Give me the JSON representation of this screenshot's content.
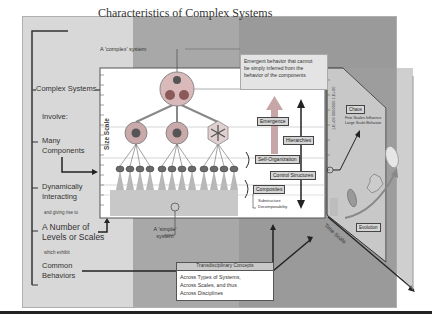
{
  "title": "Characteristics of Complex Systems",
  "left_column": {
    "header": "Complex Systems",
    "involve": "Involve:",
    "many_components": [
      "Many",
      "Components"
    ],
    "dynamically_interacting": [
      "Dynamically",
      "Interacting"
    ],
    "giving_rise": "and giving rise to",
    "levels_or_scales": [
      "A Number of",
      "Levels or Scales"
    ],
    "which_exhibit": "which exhibit",
    "common_behaviors": [
      "Common",
      "Behaviors"
    ]
  },
  "diagram": {
    "complex_system_label": "A 'complex' system",
    "simple_system_label": [
      "A 'simple'",
      "system"
    ],
    "emergent_note": [
      "Emergent behavior that cannot",
      "be simply inferred from the",
      "behavior of the components"
    ],
    "size_scale": "Size Scale",
    "time_scale": "Time Scale",
    "time_axis_ticks": "1.E+06 0000000 1.E+00",
    "labels": {
      "emergence": "Emergence",
      "hierarchies": "Hierarchies",
      "self_organization": "Self-Organization",
      "control_structures": "Control Structures",
      "composites": "Composites",
      "substructure": "Substructure",
      "decomposability": "Decomposability",
      "chaos": "Chaos",
      "chaos_note": [
        "Fine Scales Influence",
        "Large Scale Behavior"
      ],
      "evolution": "Evolution"
    }
  },
  "transdisciplinary": {
    "header": "Transdisciplinary Concepts",
    "lines": [
      "Across Types of Systems,",
      "Across Scales, and thus",
      "Across Disciplines"
    ]
  },
  "colors": {
    "slide_bg": "#d8d8d8",
    "panel_dark": "#a8a8a8",
    "panel_darker": "#9a9a9a",
    "white": "#ffffff",
    "line": "#333333"
  }
}
